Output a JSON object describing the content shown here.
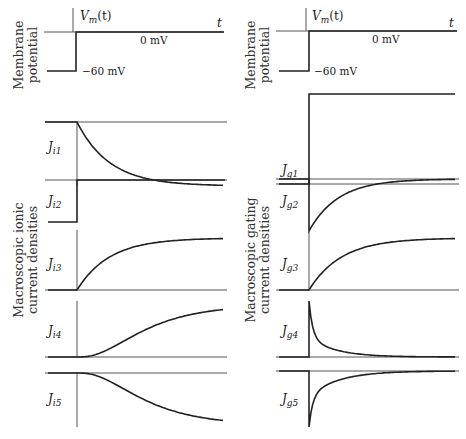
{
  "columns": [
    {
      "id": "ionic",
      "membrane": {
        "ylabel_line1": "Membrane",
        "ylabel_line2": "potential",
        "signal_label": "V",
        "signal_sub": "m",
        "signal_arg": "(t)",
        "time_label": "t",
        "level_high": "0 mV",
        "level_low": "−60 mV"
      },
      "group_label_line1": "Macroscopic ionic",
      "group_label_line2": "current densities",
      "traces": [
        {
          "name": "J",
          "sub": "i1",
          "kind": "decay_down"
        },
        {
          "name": "J",
          "sub": "i2",
          "kind": "step_up"
        },
        {
          "name": "J",
          "sub": "i3",
          "kind": "rise_exp"
        },
        {
          "name": "J",
          "sub": "i4",
          "kind": "rise_sigmoid"
        },
        {
          "name": "J",
          "sub": "i5",
          "kind": "fall_sigmoid"
        }
      ]
    },
    {
      "id": "gating",
      "membrane": {
        "ylabel_line1": "Membrane",
        "ylabel_line2": "potential",
        "signal_label": "V",
        "signal_sub": "m",
        "signal_arg": "(t)",
        "time_label": "t",
        "level_high": "0 mV",
        "level_low": "−60 mV"
      },
      "group_label_line1": "Macroscopic gating",
      "group_label_line2": "current densities",
      "traces": [
        {
          "name": "J",
          "sub": "g1",
          "kind": "step_up"
        },
        {
          "name": "J",
          "sub": "g2",
          "kind": "neg_spike_recover"
        },
        {
          "name": "J",
          "sub": "g3",
          "kind": "rise_exp"
        },
        {
          "name": "J",
          "sub": "g4",
          "kind": "pos_spike_decay"
        },
        {
          "name": "J",
          "sub": "g5",
          "kind": "neg_spike_recover_sharp"
        }
      ]
    }
  ]
}
